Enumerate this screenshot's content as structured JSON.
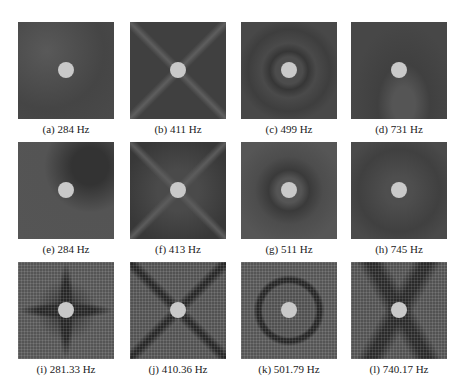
{
  "figure": {
    "rows": [
      {
        "kind": "experimental",
        "panels": [
          {
            "id": "a",
            "caption": "(a) 284 Hz",
            "frequency_hz": 284
          },
          {
            "id": "b",
            "caption": "(b) 411 Hz",
            "frequency_hz": 411
          },
          {
            "id": "c",
            "caption": "(c) 499 Hz",
            "frequency_hz": 499
          },
          {
            "id": "d",
            "caption": "(d) 731 Hz",
            "frequency_hz": 731
          }
        ]
      },
      {
        "kind": "experimental",
        "panels": [
          {
            "id": "e",
            "caption": "(e) 284 Hz",
            "frequency_hz": 284
          },
          {
            "id": "f",
            "caption": "(f) 413 Hz",
            "frequency_hz": 413
          },
          {
            "id": "g",
            "caption": "(g) 511 Hz",
            "frequency_hz": 511
          },
          {
            "id": "h",
            "caption": "(h) 745 Hz",
            "frequency_hz": 745
          }
        ]
      },
      {
        "kind": "simulation",
        "panels": [
          {
            "id": "i",
            "caption": "(i) 281.33 Hz",
            "frequency_hz": 281.33
          },
          {
            "id": "j",
            "caption": "(j) 410.36 Hz",
            "frequency_hz": 410.36
          },
          {
            "id": "k",
            "caption": "(k) 501.79 Hz",
            "frequency_hz": 501.79
          },
          {
            "id": "l",
            "caption": "(l) 740.17 Hz",
            "frequency_hz": 740.17
          }
        ]
      }
    ],
    "colors": {
      "panel_dark": "#4a4a4a",
      "nodal_line": "#262626",
      "center_mass": "#c9c9c9",
      "background": "#ffffff"
    }
  }
}
